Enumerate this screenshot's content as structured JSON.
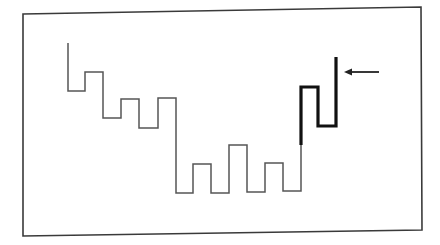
{
  "diagram": {
    "type": "step-line-diagram",
    "frame": {
      "corners": [
        [
          23,
          14
        ],
        [
          421,
          7
        ],
        [
          422,
          230
        ],
        [
          23,
          236
        ]
      ],
      "stroke_color": "#3a3a3a"
    },
    "thin_segment": {
      "description": "descending then oscillating step waveform",
      "color": "#555555",
      "points": [
        [
          68,
          43
        ],
        [
          68,
          91
        ],
        [
          85,
          91
        ],
        [
          85,
          72
        ],
        [
          103,
          72
        ],
        [
          103,
          118
        ],
        [
          121,
          118
        ],
        [
          121,
          99
        ],
        [
          139,
          99
        ],
        [
          139,
          128
        ],
        [
          158,
          128
        ],
        [
          158,
          98
        ],
        [
          176,
          98
        ],
        [
          176,
          193
        ],
        [
          193,
          193
        ],
        [
          193,
          164
        ],
        [
          211,
          164
        ],
        [
          211,
          193
        ],
        [
          229,
          193
        ],
        [
          229,
          145
        ],
        [
          247,
          145
        ],
        [
          247,
          192
        ],
        [
          265,
          192
        ],
        [
          265,
          163
        ],
        [
          283,
          163
        ],
        [
          283,
          191
        ],
        [
          301,
          191
        ],
        [
          301,
          145
        ]
      ]
    },
    "thick_segment": {
      "description": "highlighted final rising step section",
      "color": "#111111",
      "points": [
        [
          301,
          145
        ],
        [
          301,
          87
        ],
        [
          318,
          87
        ],
        [
          318,
          126
        ],
        [
          336,
          126
        ],
        [
          336,
          57
        ]
      ]
    },
    "arrow": {
      "direction": "left",
      "from": [
        379,
        72
      ],
      "to": [
        344,
        72
      ],
      "points_at": "end of thick segment",
      "color": "#222222"
    }
  }
}
